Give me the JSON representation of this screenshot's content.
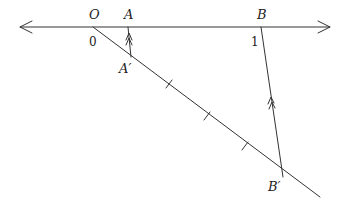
{
  "diagram": {
    "type": "geometric-construction",
    "colors": {
      "stroke": "#333333",
      "text": "#222222",
      "background": "#ffffff"
    },
    "labels": {
      "O": "O",
      "zero": "0",
      "A": "A",
      "B": "B",
      "one": "1",
      "A_prime": "A′",
      "B_prime": "B′"
    },
    "points": {
      "O": [
        93,
        27
      ],
      "A": [
        128,
        27
      ],
      "B": [
        261,
        27
      ],
      "A_prime": [
        131,
        57
      ],
      "B_prime": [
        283,
        177
      ]
    },
    "number_line": {
      "y": 27,
      "x_start": 20,
      "x_end": 330,
      "arrows": "both"
    },
    "ray": {
      "from": [
        93,
        27
      ],
      "to": [
        320,
        197
      ]
    },
    "ray_ticks": [
      [
        169,
        84
      ],
      [
        207,
        116
      ],
      [
        245,
        146
      ]
    ],
    "parallel_marks": {
      "style": "double-arrow",
      "segments": [
        "AA'",
        "BB'"
      ]
    }
  }
}
